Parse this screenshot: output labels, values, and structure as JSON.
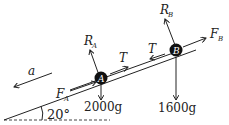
{
  "diagram": {
    "slope_angle": "20°",
    "acceleration": "a",
    "block_a": {
      "label": "A",
      "reaction": "R",
      "reaction_sub": "A",
      "force": "F",
      "force_sub": "A",
      "weight": "2000g"
    },
    "block_b": {
      "label": "B",
      "reaction": "R",
      "reaction_sub": "B",
      "force": "F",
      "force_sub": "B",
      "weight": "1600g"
    },
    "tension_a": "T",
    "tension_b": "T"
  }
}
